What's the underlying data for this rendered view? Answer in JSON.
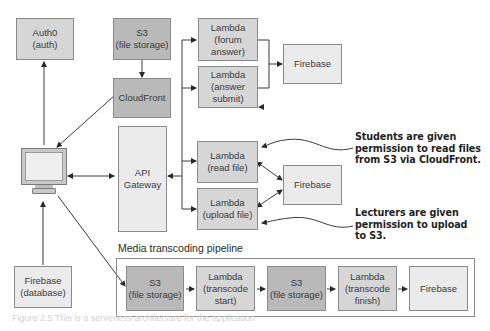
{
  "diagram": {
    "nodes": {
      "auth0": {
        "label": "Auth0\n(auth)",
        "shade": "mid"
      },
      "s3_top": {
        "label": "S3\n(file storage)",
        "shade": "dark"
      },
      "cloudfront": {
        "label": "CloudFront",
        "shade": "dark"
      },
      "lambda_forum_answer": {
        "label": "Lambda\n(forum\nanswer)",
        "shade": "mid"
      },
      "lambda_answer_submit": {
        "label": "Lambda\n(answer\nsubmit)",
        "shade": "mid"
      },
      "firebase_top": {
        "label": "Firebase",
        "shade": "light"
      },
      "client": {
        "label": "",
        "icon": "monitor-icon"
      },
      "api_gateway": {
        "label": "API\nGateway",
        "shade": "light"
      },
      "lambda_read_file": {
        "label": "Lambda\n(read file)",
        "shade": "mid"
      },
      "lambda_upload_file": {
        "label": "Lambda\n(upload file)",
        "shade": "mid"
      },
      "firebase_mid": {
        "label": "Firebase",
        "shade": "light"
      },
      "firebase_db": {
        "label": "Firebase\n(database)",
        "shade": "light"
      },
      "pipe_s3_1": {
        "label": "S3\n(file storage)",
        "shade": "dark"
      },
      "pipe_lambda_start": {
        "label": "Lambda\n(transcode\nstart)",
        "shade": "mid"
      },
      "pipe_s3_2": {
        "label": "S3\n(file storage)",
        "shade": "dark"
      },
      "pipe_lambda_finish": {
        "label": "Lambda\n(transcode\nfinish)",
        "shade": "mid"
      },
      "pipe_firebase": {
        "label": "Firebase",
        "shade": "light"
      }
    },
    "group": {
      "label": "Media transcoding pipeline"
    },
    "annotations": {
      "students": "Students are given\npermission to read files\nfrom S3 via CloudFront.",
      "lecturers": "Lecturers are given\npermission to upload\nto S3."
    },
    "edges": [
      {
        "from": "client",
        "to": "auth0"
      },
      {
        "from": "s3_top",
        "to": "cloudfront"
      },
      {
        "from": "cloudfront",
        "to": "client"
      },
      {
        "from": "client",
        "to": "api_gateway",
        "bidirectional": true
      },
      {
        "from": "api_gateway",
        "to": "lambda_forum_answer"
      },
      {
        "from": "api_gateway",
        "to": "lambda_answer_submit"
      },
      {
        "from": "api_gateway",
        "to": "lambda_read_file"
      },
      {
        "from": "api_gateway",
        "to": "lambda_upload_file"
      },
      {
        "from": "lambda_forum_answer",
        "to": "firebase_top"
      },
      {
        "from": "lambda_answer_submit",
        "to": "firebase_top"
      },
      {
        "from": "lambda_read_file",
        "to": "firebase_mid",
        "bidirectional": true
      },
      {
        "from": "lambda_upload_file",
        "to": "firebase_mid",
        "bidirectional": true
      },
      {
        "from": "firebase_db",
        "to": "client"
      },
      {
        "from": "client",
        "to": "pipe_s3_1"
      },
      {
        "from": "pipe_s3_1",
        "to": "pipe_lambda_start"
      },
      {
        "from": "pipe_lambda_start",
        "to": "pipe_s3_2"
      },
      {
        "from": "pipe_s3_2",
        "to": "pipe_lambda_finish"
      },
      {
        "from": "pipe_lambda_finish",
        "to": "pipe_firebase"
      }
    ],
    "colors": {
      "light": "#ebebeb",
      "mid": "#d6d6d6",
      "dark": "#b9b9b9",
      "line": "#3a3a3a"
    }
  },
  "caption": "Figure 2.5  This is a serverless architecture for the application"
}
